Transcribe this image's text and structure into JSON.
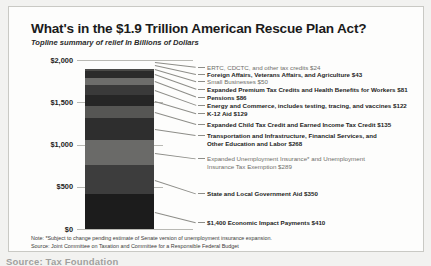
{
  "header": {
    "title": "What's in the $1.9 Trillion American Rescue Plan Act?",
    "subtitle": "Topline summary of relief In Billions of Dollars"
  },
  "footer": {
    "note": "Note: *Subject to change pending estimate of Senate version of unemployment insurance expansion.",
    "source": "Source: Joint Committee on Taxation and Committee for a Responsible Federal Budget",
    "caption": "Source: Tax Foundation"
  },
  "chart_data": {
    "type": "bar",
    "title": "What's in the $1.9 Trillion American Rescue Plan Act?",
    "subtitle": "Topline summary of relief In Billions of Dollars",
    "xlabel": "",
    "ylabel": "Billions of Dollars",
    "ylim": [
      0,
      2000
    ],
    "yticks": [
      "$0",
      "$500",
      "$1,000",
      "$1,500",
      "$2,000"
    ],
    "ytick_values": [
      0,
      500,
      1000,
      1500,
      2000
    ],
    "grid": true,
    "legend": "none",
    "stacked": true,
    "categories": [
      "American Rescue Plan Act"
    ],
    "total": 1899,
    "series": [
      {
        "name": "$1,400 Economic Impact Payments",
        "label": "$1,400 Economic Impact Payments $410",
        "value": 410,
        "color": "#1c1c1c",
        "emphasis": true
      },
      {
        "name": "State and Local Government Aid",
        "label": "State and Local Government Aid $350",
        "value": 350,
        "color": "#3d3d3d",
        "emphasis": true
      },
      {
        "name": "Expanded Unemployment Insurance* and Unemployment Insurance Tax Exemption",
        "label": "Expanded Unemployment Insurance* and Unemployment Insurance Tax Exemption $289",
        "value": 289,
        "color": "#6a6a68",
        "emphasis": false
      },
      {
        "name": "Transportation and Infrastructure, Financial Services, and Other Education and Labor",
        "label": "Transportation and Infrastructure, Financial Services, and Other Education and Labor $268",
        "value": 268,
        "color": "#2e2e2e",
        "emphasis": true
      },
      {
        "name": "Expanded Child Tax Credit and Earned Income Tax Credit",
        "label": "Expanded Child Tax Credit and Earned Income Tax Credit $135",
        "value": 135,
        "color": "#565654",
        "emphasis": true
      },
      {
        "name": "K-12 Aid",
        "label": "K-12 Aid $129",
        "value": 129,
        "color": "#262626",
        "emphasis": true
      },
      {
        "name": "Energy and Commerce, includes testing, tracing, and vaccines",
        "label": "Energy and Commerce, includes testing, tracing, and vaccines $122",
        "value": 122,
        "color": "#3a3a3a",
        "emphasis": true
      },
      {
        "name": "Pensions",
        "label": "Pensions $86",
        "value": 86,
        "color": "#6d6d6b",
        "emphasis": true
      },
      {
        "name": "Expanded Premium Tax Credits and Health Benefits for Workers",
        "label": "Expanded Premium Tax Credits and Health Benefits for Workers $81",
        "value": 81,
        "color": "#2b2b2b",
        "emphasis": true
      },
      {
        "name": "Small Businesses",
        "label": "Small Businesses $50",
        "value": 50,
        "color": "#4a4a48",
        "emphasis": false
      },
      {
        "name": "Foreign Affairs, Veterans Affairs, and Agriculture",
        "label": "Foreign Affairs, Veterans Affairs, and Agriculture $43",
        "value": 43,
        "color": "#5e5e5c",
        "emphasis": true
      },
      {
        "name": "ERTC, CDCTC, and other tax credits",
        "label": "ERTC, CDCTC, and other tax credits $24",
        "value": 24,
        "color": "#7a7a78",
        "emphasis": false
      }
    ]
  }
}
